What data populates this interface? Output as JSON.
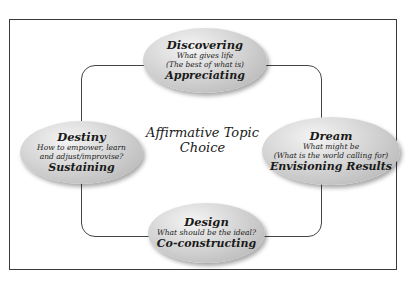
{
  "diagram": {
    "center": {
      "line1": "Affirmative Topic",
      "line2": "Choice"
    },
    "nodes": {
      "top": {
        "title": "Discovering",
        "sub1": "What gives life",
        "sub2": "(The best of what is)",
        "label": "Appreciating"
      },
      "right": {
        "title": "Dream",
        "sub1": "What might be",
        "sub2": "(What is the world calling for)",
        "label": "Envisioning Results"
      },
      "bottom": {
        "title": "Design",
        "sub1": "What should be the ideal?",
        "label": "Co-constructing"
      },
      "left": {
        "title": "Destiny",
        "sub1": "How to empower, learn",
        "sub2": "and adjust/improvise?",
        "label": "Sustaining"
      }
    },
    "colors": {
      "frame": "#3a3a3a",
      "node_fill": "#c4c4c4",
      "node_highlight": "#f4f4f4",
      "text": "#1a1a1a"
    }
  }
}
